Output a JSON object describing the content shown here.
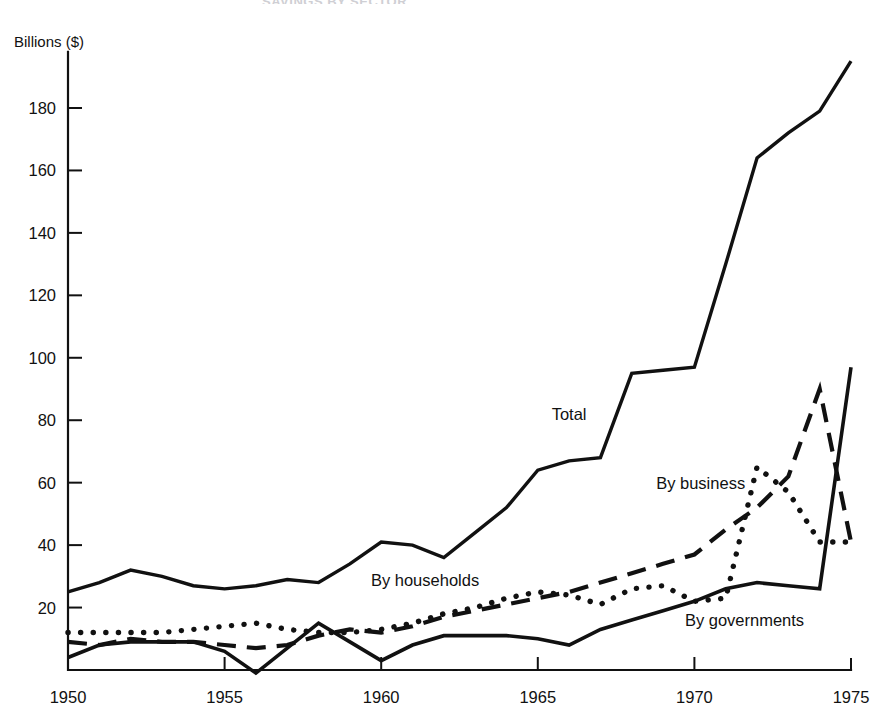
{
  "figure": {
    "cut_off_title": "SAVINGS BY SECTOR",
    "y_axis_label": "Billions ($)"
  },
  "chart_data": {
    "type": "line",
    "title": "",
    "xlabel": "",
    "ylabel": "Billions ($)",
    "xlim": [
      1950,
      1975
    ],
    "ylim": [
      -5,
      200
    ],
    "yticks": [
      20,
      40,
      60,
      80,
      100,
      120,
      140,
      160,
      180
    ],
    "xticks": [
      1950,
      1955,
      1960,
      1965,
      1970,
      1975
    ],
    "grid": false,
    "legend": "inline-annotations",
    "x": [
      1950,
      1951,
      1952,
      1953,
      1954,
      1955,
      1956,
      1957,
      1958,
      1959,
      1960,
      1961,
      1962,
      1963,
      1964,
      1965,
      1966,
      1967,
      1968,
      1969,
      1970,
      1971,
      1972,
      1973,
      1974,
      1975
    ],
    "series": [
      {
        "name": "Total",
        "style": "solid",
        "values": [
          25,
          28,
          32,
          30,
          27,
          26,
          27,
          29,
          28,
          34,
          41,
          40,
          36,
          44,
          52,
          64,
          67,
          68,
          95,
          96,
          97,
          130,
          164,
          172,
          179,
          195
        ]
      },
      {
        "name": "By business",
        "style": "dashed",
        "values": [
          9,
          8,
          10,
          9,
          9,
          8,
          7,
          8,
          11,
          13,
          12,
          14,
          17,
          19,
          21,
          23,
          25,
          28,
          31,
          34,
          37,
          45,
          52,
          62,
          90,
          41
        ]
      },
      {
        "name": "By households",
        "style": "dotted",
        "values": [
          12,
          12,
          12,
          12,
          13,
          14,
          15,
          13,
          12,
          12,
          13,
          15,
          18,
          20,
          23,
          25,
          24,
          21,
          26,
          27,
          22,
          23,
          65,
          57,
          41,
          41
        ]
      },
      {
        "name": "By governments",
        "style": "solid",
        "values": [
          4,
          8,
          9,
          9,
          9,
          6,
          -1,
          7,
          15,
          9,
          3,
          8,
          11,
          11,
          11,
          10,
          8,
          13,
          16,
          19,
          22,
          26,
          28,
          27,
          26,
          97
        ]
      }
    ],
    "annotations": [
      {
        "text": "Total",
        "x": 1966.0,
        "y": 80
      },
      {
        "text": "By business",
        "x": 1970.2,
        "y": 58
      },
      {
        "text": "By households",
        "x": 1961.4,
        "y": 27
      },
      {
        "text": "By governments",
        "x": 1971.6,
        "y": 14
      }
    ]
  }
}
